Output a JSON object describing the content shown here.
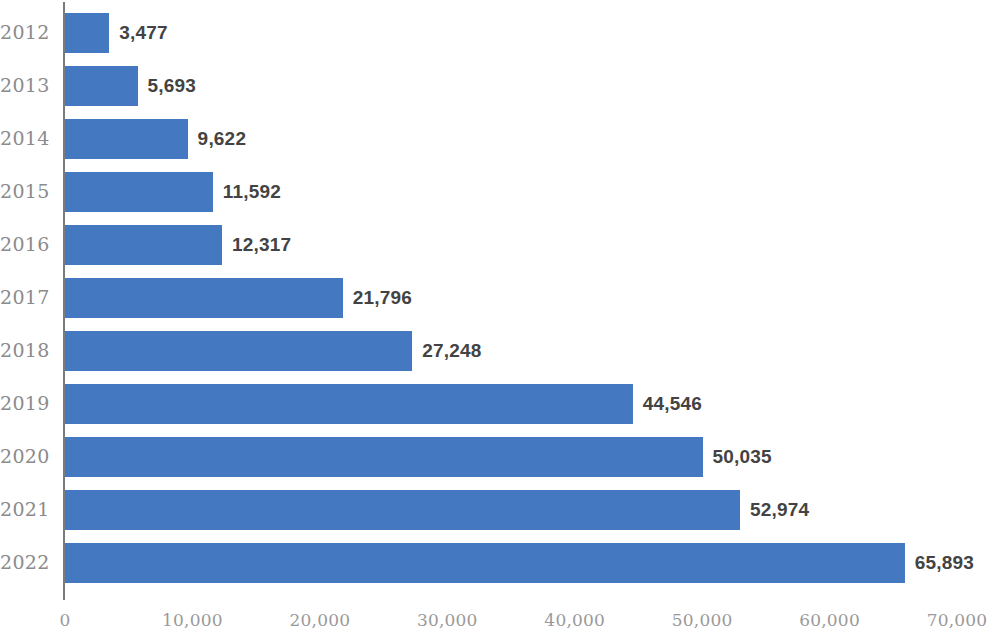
{
  "chart": {
    "bar_color": "#4478c0",
    "axis_color": "#7a7a7a",
    "label_color": "#8b8b8b",
    "value_color": "#434343",
    "background": "#ffffff"
  },
  "chart_data": {
    "type": "bar",
    "orientation": "horizontal",
    "title": "",
    "subtitle": "",
    "xlabel": "",
    "ylabel": "",
    "categories": [
      "2012",
      "2013",
      "2014",
      "2015",
      "2016",
      "2017",
      "2018",
      "2019",
      "2020",
      "2021",
      "2022"
    ],
    "values": [
      3477,
      5693,
      9622,
      11592,
      12317,
      21796,
      27248,
      44546,
      50035,
      52974,
      65893
    ],
    "value_labels": [
      "3,477",
      "5,693",
      "9,622",
      "11,592",
      "12,317",
      "21,796",
      "27,248",
      "44,546",
      "50,035",
      "52,974",
      "65,893"
    ],
    "xlim": [
      0,
      70000
    ],
    "xticks": [
      0,
      10000,
      20000,
      30000,
      40000,
      50000,
      60000,
      70000
    ],
    "xtick_labels": [
      "0",
      "10,000",
      "20,000",
      "30,000",
      "40,000",
      "50,000",
      "60,000",
      "70,000"
    ],
    "grid": false,
    "legend": null,
    "series": [
      {
        "name": "",
        "values": [
          3477,
          5693,
          9622,
          11592,
          12317,
          21796,
          27248,
          44546,
          50035,
          52974,
          65893
        ]
      }
    ]
  }
}
